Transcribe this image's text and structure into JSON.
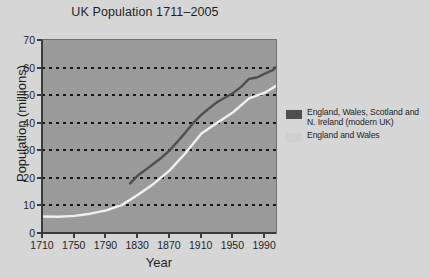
{
  "chart_data": {
    "type": "line",
    "title": "UK Population 1711–2005",
    "xlabel": "Year",
    "ylabel": "Population (millions)",
    "xlim": [
      1710,
      2005
    ],
    "ylim": [
      0,
      70
    ],
    "xticks": [
      1710,
      1750,
      1790,
      1830,
      1870,
      1910,
      1950,
      1990
    ],
    "yticks": [
      0,
      10,
      20,
      30,
      40,
      50,
      60,
      70
    ],
    "grid": "horizontal-dotted",
    "legend_position": "right",
    "plot_background": "#9b9b9b",
    "series": [
      {
        "name": "England, Wales, Scotland and N. Ireland (modern UK)",
        "color": "#4e4e4e",
        "x": [
          1821,
          1831,
          1841,
          1851,
          1861,
          1871,
          1881,
          1891,
          1901,
          1911,
          1921,
          1931,
          1951,
          1961,
          1971,
          1981,
          1991,
          2001,
          2005
        ],
        "values": [
          18.0,
          20.9,
          23.0,
          25.2,
          27.4,
          30.0,
          33.2,
          36.5,
          40.0,
          42.9,
          45.3,
          47.5,
          50.8,
          53.0,
          55.9,
          56.4,
          57.8,
          59.1,
          60.2
        ]
      },
      {
        "name": "England and Wales",
        "color": "#f2f2f2",
        "x": [
          1711,
          1731,
          1751,
          1771,
          1791,
          1811,
          1831,
          1851,
          1871,
          1891,
          1911,
          1931,
          1951,
          1971,
          1991,
          2005
        ],
        "values": [
          6.0,
          5.9,
          6.2,
          7.0,
          8.2,
          10.2,
          13.9,
          17.9,
          22.7,
          29.0,
          36.1,
          40.0,
          43.8,
          48.8,
          50.9,
          53.4
        ]
      }
    ]
  },
  "legend": {
    "entries": [
      {
        "line1": "England, Wales, Scotland and",
        "line2": "N. Ireland (modern UK)",
        "color": "#4e4e4e"
      },
      {
        "line1": "England and Wales",
        "line2": "",
        "color": "#cfcfcf"
      }
    ]
  }
}
